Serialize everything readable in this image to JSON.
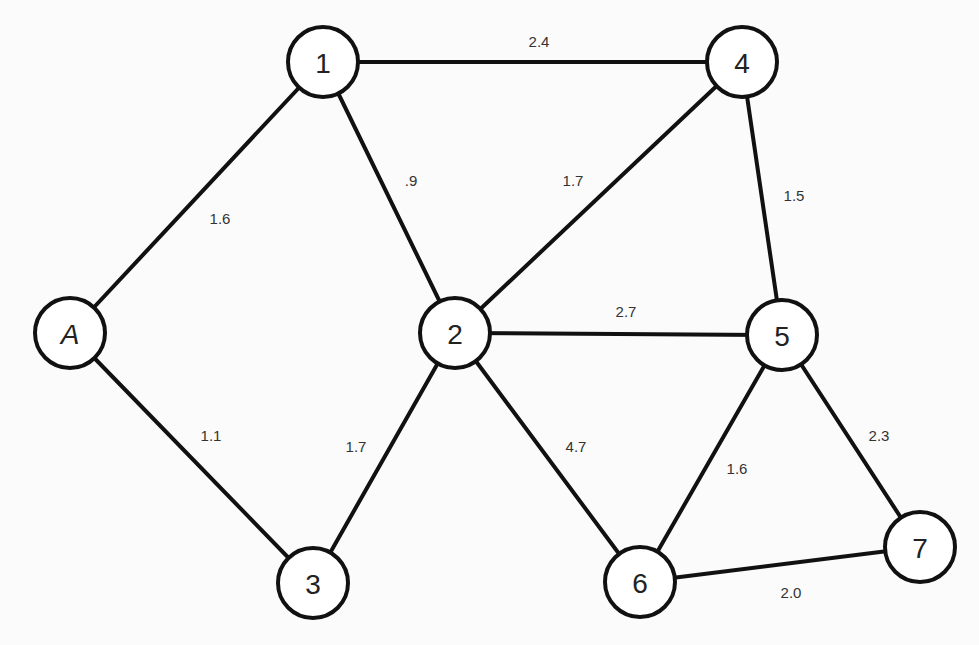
{
  "diagram": {
    "type": "weighted-undirected-graph",
    "nodes": [
      {
        "id": "1",
        "label": "1",
        "x": 323,
        "y": 62,
        "italic": false
      },
      {
        "id": "4",
        "label": "4",
        "x": 742,
        "y": 62,
        "italic": false
      },
      {
        "id": "A",
        "label": "A",
        "x": 70,
        "y": 333,
        "italic": true
      },
      {
        "id": "2",
        "label": "2",
        "x": 455,
        "y": 333,
        "italic": false
      },
      {
        "id": "5",
        "label": "5",
        "x": 782,
        "y": 335,
        "italic": false
      },
      {
        "id": "3",
        "label": "3",
        "x": 313,
        "y": 583,
        "italic": false
      },
      {
        "id": "6",
        "label": "6",
        "x": 640,
        "y": 582,
        "italic": false
      },
      {
        "id": "7",
        "label": "7",
        "x": 920,
        "y": 547,
        "italic": false
      }
    ],
    "edges": [
      {
        "from": "1",
        "to": "4",
        "weight": "2.4",
        "lx": 539,
        "ly": 41
      },
      {
        "from": "A",
        "to": "1",
        "weight": "1.6",
        "lx": 220,
        "ly": 218
      },
      {
        "from": "1",
        "to": "2",
        "weight": ".9",
        "lx": 411,
        "ly": 180
      },
      {
        "from": "2",
        "to": "4",
        "weight": "1.7",
        "lx": 573,
        "ly": 180
      },
      {
        "from": "4",
        "to": "5",
        "weight": "1.5",
        "lx": 794,
        "ly": 195
      },
      {
        "from": "2",
        "to": "5",
        "weight": "2.7",
        "lx": 626,
        "ly": 311
      },
      {
        "from": "A",
        "to": "3",
        "weight": "1.1",
        "lx": 211,
        "ly": 435
      },
      {
        "from": "2",
        "to": "3",
        "weight": "1.7",
        "lx": 356,
        "ly": 446
      },
      {
        "from": "2",
        "to": "6",
        "weight": "4.7",
        "lx": 576,
        "ly": 446
      },
      {
        "from": "5",
        "to": "6",
        "weight": "1.6",
        "lx": 737,
        "ly": 468
      },
      {
        "from": "5",
        "to": "7",
        "weight": "2.3",
        "lx": 879,
        "ly": 435
      },
      {
        "from": "6",
        "to": "7",
        "weight": "2.0",
        "lx": 791,
        "ly": 592
      }
    ],
    "node_radius": 35,
    "colors": {
      "stroke": "#111111",
      "node_fill": "#ffffff",
      "background": "#fbfbfb",
      "label": "#333333"
    }
  }
}
